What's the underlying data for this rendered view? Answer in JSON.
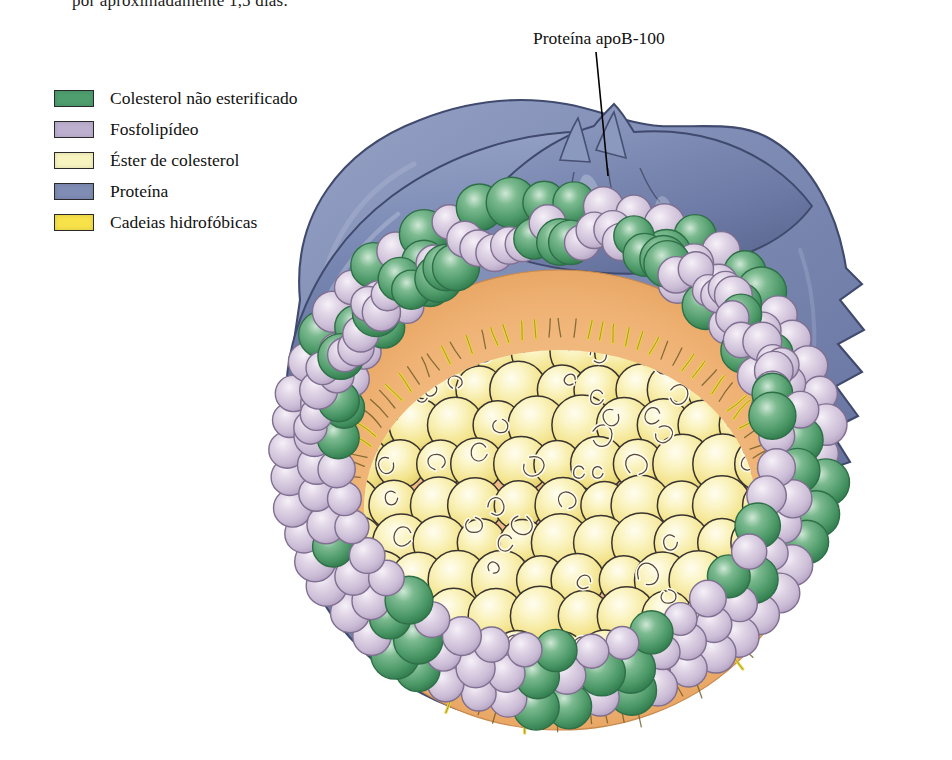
{
  "page": {
    "truncated_top_line": "por aproximadamente 1,5 dias.",
    "background_color": "#ffffff"
  },
  "legend": {
    "items": [
      {
        "label": "Colesterol não esterificado",
        "color": "#4e9e6e",
        "swatch_name": "legend-swatch-unesterified-cholesterol"
      },
      {
        "label": "Fosfolipídeo",
        "color": "#bdb0cf",
        "swatch_name": "legend-swatch-phospholipid"
      },
      {
        "label": "Éster de colesterol",
        "color": "#f8f4c0",
        "swatch_name": "legend-swatch-cholesterol-ester"
      },
      {
        "label": "Proteína",
        "color": "#7f8cb4",
        "swatch_name": "legend-swatch-protein"
      },
      {
        "label": "Cadeias hidrofóbicas",
        "color": "#f7e24a",
        "swatch_name": "legend-swatch-hydrophobic-chains"
      }
    ]
  },
  "callouts": [
    {
      "label": "Proteína apoB-100",
      "name": "callout-apob-100"
    }
  ],
  "figure": {
    "colors": {
      "protein": "#7f8cb4",
      "protein_dark": "#5d6b95",
      "protein_light": "#9fa9c9",
      "cholesterol_green": "#57a070",
      "cholesterol_green_dark": "#2f7b4c",
      "phospholipid_head": "#d9cde0",
      "phospholipid_head_dark": "#b6a5c4",
      "core_band": "#f0b678",
      "core_band_light": "#f7d3a6",
      "ester_sphere": "#f7eb9a",
      "ester_sphere_light": "#fdf8d6",
      "chain_yellow": "#e8d43a",
      "outline": "#3a3430"
    },
    "structure": {
      "shell_rings": 3,
      "core_sphere_rows": 9,
      "surface_head_count": 190,
      "hydrophobic_chain_count": 96
    }
  }
}
